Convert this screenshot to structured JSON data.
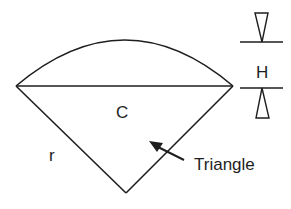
{
  "diagram": {
    "type": "circular-segment-geometry",
    "labels": {
      "chord": "C",
      "radius": "r",
      "height": "H",
      "triangle": "Triangle"
    },
    "colors": {
      "stroke": "#1e1e1e",
      "background": "#ffffff"
    }
  }
}
